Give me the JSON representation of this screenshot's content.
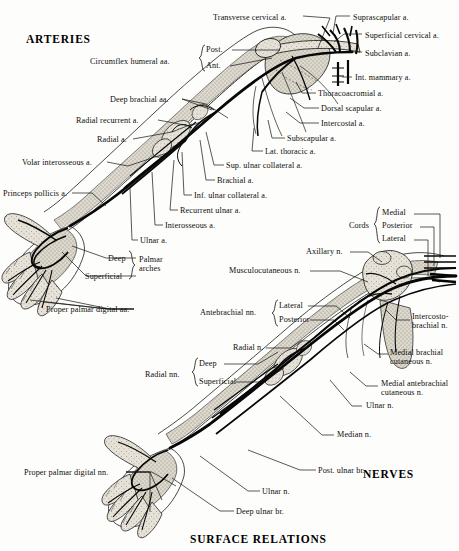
{
  "figure": {
    "caption": "SURFACE RELATIONS",
    "panels": [
      {
        "id": "arteries",
        "title": "ARTERIES"
      },
      {
        "id": "nerves",
        "title": "NERVES"
      }
    ]
  },
  "arteries": {
    "title": "ARTERIES",
    "labels": [
      {
        "id": "transverse-cervical",
        "text": "Transverse cervical a.",
        "x": 213,
        "y": 13,
        "align": "left"
      },
      {
        "id": "suprascapular",
        "text": "Suprascapular a.",
        "x": 353,
        "y": 13,
        "align": "left"
      },
      {
        "id": "superficial-cervical",
        "text": "Superficial cervical a.",
        "x": 365,
        "y": 31,
        "align": "left"
      },
      {
        "id": "subclavian",
        "text": "Subclavian a.",
        "x": 365,
        "y": 49,
        "align": "left"
      },
      {
        "id": "circumflex-humeral",
        "text": "Circumflex humeral aa.",
        "x": 90,
        "y": 57,
        "align": "left"
      },
      {
        "id": "circumflex-post",
        "text": "Post.",
        "x": 206,
        "y": 49,
        "align": "left"
      },
      {
        "id": "circumflex-ant",
        "text": "Ant.",
        "x": 206,
        "y": 64,
        "align": "left"
      },
      {
        "id": "int-mammary",
        "text": "Int. mammary a.",
        "x": 355,
        "y": 74,
        "align": "left"
      },
      {
        "id": "thoracoacromial",
        "text": "Thoracoacromial a.",
        "x": 318,
        "y": 90,
        "align": "left"
      },
      {
        "id": "deep-brachial",
        "text": "Deep brachial aa.",
        "x": 110,
        "y": 96,
        "align": "left"
      },
      {
        "id": "dorsal-scapular",
        "text": "Dorsal scapular a.",
        "x": 321,
        "y": 105,
        "align": "left"
      },
      {
        "id": "intercostal",
        "text": "Intercostal a.",
        "x": 321,
        "y": 120,
        "align": "left"
      },
      {
        "id": "radial-recurrent",
        "text": "Radial recurrent a.",
        "x": 76,
        "y": 117,
        "align": "left"
      },
      {
        "id": "subscapular",
        "text": "Subscapular a.",
        "x": 287,
        "y": 135,
        "align": "left"
      },
      {
        "id": "radial",
        "text": "Radial a.",
        "x": 97,
        "y": 136,
        "align": "left"
      },
      {
        "id": "lat-thoracic",
        "text": "Lat. thoracic a.",
        "x": 265,
        "y": 148,
        "align": "left"
      },
      {
        "id": "sup-ulnar-collateral",
        "text": "Sup. ulnar collateral a.",
        "x": 226,
        "y": 162,
        "align": "left"
      },
      {
        "id": "volar-interosseous",
        "text": "Volar interosseous a.",
        "x": 22,
        "y": 159,
        "align": "left"
      },
      {
        "id": "brachial",
        "text": "Brachial a.",
        "x": 217,
        "y": 177,
        "align": "left"
      },
      {
        "id": "inf-ulnar-collateral",
        "text": "Inf. ulnar collateral a.",
        "x": 194,
        "y": 192,
        "align": "left"
      },
      {
        "id": "princeps-pollicis",
        "text": "Princeps pollicis a.",
        "x": 3,
        "y": 190,
        "align": "left"
      },
      {
        "id": "recurrent-ulnar",
        "text": "Recurrent ulnar a.",
        "x": 180,
        "y": 207,
        "align": "left"
      },
      {
        "id": "interosseous",
        "text": "Interosseous a.",
        "x": 165,
        "y": 222,
        "align": "left"
      },
      {
        "id": "ulnar",
        "text": "Ulnar a.",
        "x": 140,
        "y": 237,
        "align": "left"
      },
      {
        "id": "palmar-arch-deep",
        "text": "Deep",
        "x": 108,
        "y": 255,
        "align": "left"
      },
      {
        "id": "palmar-arch-superficial",
        "text": "Superficial",
        "x": 88,
        "y": 273,
        "align": "left"
      },
      {
        "id": "palmar-arches",
        "text": "Palmar\narches",
        "x": 140,
        "y": 257,
        "align": "left"
      },
      {
        "id": "proper-palmar-digital-aa",
        "text": "Proper palmar digital aa.",
        "x": 48,
        "y": 306,
        "align": "left"
      }
    ]
  },
  "nerves": {
    "title": "NERVES",
    "labels": [
      {
        "id": "cords",
        "text": "Cords",
        "x": 351,
        "y": 224,
        "align": "left"
      },
      {
        "id": "cord-medial",
        "text": "Medial",
        "x": 381,
        "y": 211,
        "align": "left"
      },
      {
        "id": "cord-posterior",
        "text": "Posterior",
        "x": 381,
        "y": 224,
        "align": "left"
      },
      {
        "id": "cord-lateral",
        "text": "Lateral",
        "x": 381,
        "y": 237,
        "align": "left"
      },
      {
        "id": "axillary",
        "text": "Axillary n.",
        "x": 306,
        "y": 249,
        "align": "left"
      },
      {
        "id": "musculocutaneous",
        "text": "Musculocutaneous n.",
        "x": 229,
        "y": 268,
        "align": "left"
      },
      {
        "id": "antebrachial-nn",
        "text": "Antebrachial nn.",
        "x": 202,
        "y": 310,
        "align": "left"
      },
      {
        "id": "antebrachial-lateral",
        "text": "Lateral",
        "x": 279,
        "y": 303,
        "align": "left"
      },
      {
        "id": "antebrachial-posterior",
        "text": "Posterior",
        "x": 279,
        "y": 317,
        "align": "left"
      },
      {
        "id": "intercostobrachial",
        "text": "Intercosto-\nbrachial n.",
        "x": 413,
        "y": 313,
        "align": "left"
      },
      {
        "id": "radial-n",
        "text": "Radial n.",
        "x": 233,
        "y": 345,
        "align": "left"
      },
      {
        "id": "medial-brachial-cutaneous",
        "text": "Medial brachial\ncutaneous n.",
        "x": 393,
        "y": 349,
        "align": "left"
      },
      {
        "id": "radial-nn",
        "text": "Radial nn.",
        "x": 145,
        "y": 372,
        "align": "left"
      },
      {
        "id": "radial-deep",
        "text": "Deep",
        "x": 199,
        "y": 361,
        "align": "left"
      },
      {
        "id": "radial-superficial",
        "text": "Superficial",
        "x": 199,
        "y": 379,
        "align": "left"
      },
      {
        "id": "medial-antebrachial-cutaneous",
        "text": "Medial antebrachial\ncutaneous n.",
        "x": 383,
        "y": 380,
        "align": "left"
      },
      {
        "id": "ulnar-n-upper",
        "text": "Ulnar n.",
        "x": 366,
        "y": 403,
        "align": "left"
      },
      {
        "id": "median",
        "text": "Median n.",
        "x": 337,
        "y": 432,
        "align": "left"
      },
      {
        "id": "proper-palmar-digital-nn",
        "text": "Proper palmar digital nn.",
        "x": 25,
        "y": 469,
        "align": "left"
      },
      {
        "id": "post-ulnar-br",
        "text": "Post. ulnar br.",
        "x": 318,
        "y": 467,
        "align": "left"
      },
      {
        "id": "ulnar-n-lower",
        "text": "Ulnar n.",
        "x": 262,
        "y": 488,
        "align": "left"
      },
      {
        "id": "deep-ulnar-br",
        "text": "Deep ulnar br.",
        "x": 236,
        "y": 508,
        "align": "left"
      }
    ]
  },
  "style": {
    "ink": "#111111",
    "paper": "#fdfdfb",
    "vessel": "#0a0a0a",
    "tissue_fill": "#cfcabf",
    "bone_fill": "#e4e0d6"
  }
}
